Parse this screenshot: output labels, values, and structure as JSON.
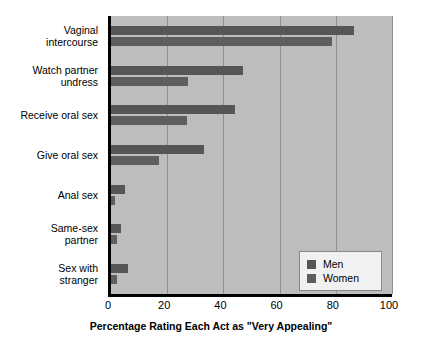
{
  "chart_data": {
    "type": "bar",
    "orientation": "horizontal",
    "title": "",
    "xlabel": "Percentage Rating Each Act as \"Very Appealing\"",
    "ylabel": "",
    "xlim": [
      0,
      100
    ],
    "xticks": [
      0,
      20,
      40,
      60,
      80,
      100
    ],
    "xtick_labels": [
      "0",
      "20",
      "40",
      "60",
      "80",
      "100"
    ],
    "grid": true,
    "grid_axis": "x",
    "legend_position": "lower right",
    "categories": [
      "Vaginal\nintercourse",
      "Watch partner\nundress",
      "Receive oral sex",
      "Give oral sex",
      "Anal sex",
      "Same-sex\npartner",
      "Sex with\nstranger"
    ],
    "series": [
      {
        "name": "Men",
        "color": "#565656",
        "values": [
          86.5,
          47,
          44,
          33,
          5,
          3.5,
          6
        ]
      },
      {
        "name": "Women",
        "color": "#5e5e5e",
        "values": [
          78.5,
          27.5,
          27,
          17,
          1.5,
          2,
          2
        ]
      }
    ],
    "plot_background": "#bdbdbd"
  },
  "legend": {
    "entries": [
      {
        "label": "Men"
      },
      {
        "label": "Women"
      }
    ]
  }
}
